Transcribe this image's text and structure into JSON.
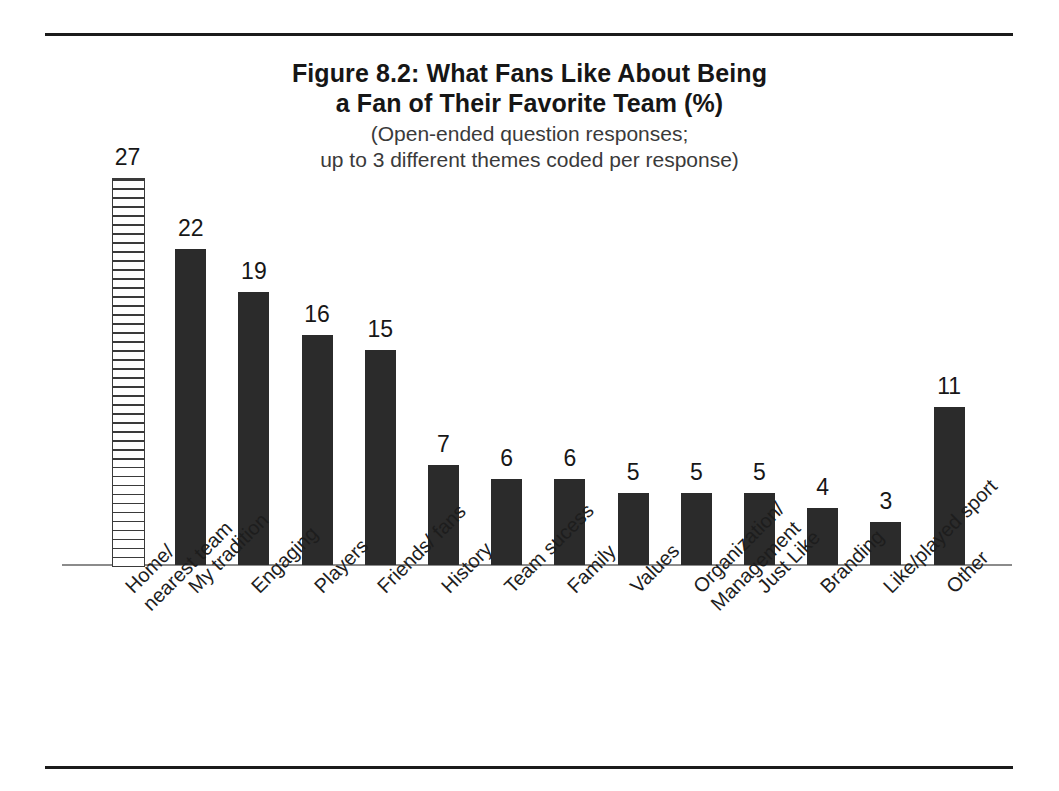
{
  "figure": {
    "title_lines": [
      "Figure 8.2: What Fans Like  About Being",
      "a Fan of Their Favorite Team (%)"
    ],
    "subtitle_lines": [
      "(Open-ended question responses;",
      "up to 3 different themes coded per response)"
    ]
  },
  "colors": {
    "bar_fill": "#2b2b2b",
    "hatch_stroke": "#3a3a3a",
    "axis": "#8b8b8b",
    "rule": "#1b1b1b",
    "text": "#1b1b1b"
  },
  "chart_data": {
    "type": "bar",
    "title": "Figure 8.2: What Fans Like  About Being a Fan of Their Favorite Team (%)",
    "subtitle": "(Open-ended question responses; up to 3 different themes coded per response)",
    "xlabel": "",
    "ylabel": "",
    "ylim": [
      0,
      27
    ],
    "grid": false,
    "legend": "none",
    "value_labels": true,
    "categories": [
      "Home/ nearest team",
      "My tradition",
      "Engaging",
      "Players",
      "Friends/ fans",
      "History",
      "Team sucess",
      "Family",
      "Values",
      "Organization/ Management",
      "Just Like",
      "Branding",
      "Like/played sport",
      "Other"
    ],
    "category_lines": [
      [
        "Home/",
        "nearest team"
      ],
      [
        "My tradition",
        ""
      ],
      [
        "Engaging",
        ""
      ],
      [
        "Players",
        ""
      ],
      [
        "Friends/ fans",
        ""
      ],
      [
        "History",
        ""
      ],
      [
        "Team sucess",
        ""
      ],
      [
        "Family",
        ""
      ],
      [
        "Values",
        ""
      ],
      [
        "Organization/",
        "Management"
      ],
      [
        "Just Like",
        ""
      ],
      [
        "Branding",
        ""
      ],
      [
        "Like/played sport",
        ""
      ],
      [
        "Other",
        ""
      ]
    ],
    "values": [
      27,
      22,
      19,
      16,
      15,
      7,
      6,
      6,
      5,
      5,
      5,
      4,
      3,
      11
    ],
    "bar_styles": [
      "hatched",
      "solid",
      "solid",
      "solid",
      "solid",
      "solid",
      "solid",
      "solid",
      "solid",
      "solid",
      "solid",
      "solid",
      "solid",
      "solid"
    ]
  }
}
